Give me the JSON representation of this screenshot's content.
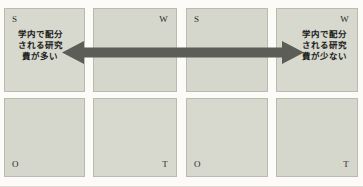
{
  "diagram": {
    "type": "paired-swot-matrix",
    "box_fill_color": "#d6d7cd",
    "box_border_color": "#b9bab0",
    "arrow_color": "#5d5d57",
    "text_color": "#1c1c1a",
    "background_color": "#fcfbf7"
  },
  "matrices": [
    {
      "name": "left-swot-matrix",
      "cells": [
        {
          "key": "s",
          "letter": "S",
          "corner": "top-left"
        },
        {
          "key": "w",
          "letter": "W",
          "corner": "top-right"
        },
        {
          "key": "o",
          "letter": "O",
          "corner": "bottom-left"
        },
        {
          "key": "t",
          "letter": "T",
          "corner": "bottom-right"
        }
      ]
    },
    {
      "name": "right-swot-matrix",
      "cells": [
        {
          "key": "s",
          "letter": "S",
          "corner": "top-left"
        },
        {
          "key": "w",
          "letter": "W",
          "corner": "top-right"
        },
        {
          "key": "o",
          "letter": "O",
          "corner": "bottom-left"
        },
        {
          "key": "t",
          "letter": "T",
          "corner": "bottom-right"
        }
      ]
    }
  ],
  "letters": {
    "m1_s": "S",
    "m1_w": "W",
    "m1_o": "O",
    "m1_t": "T",
    "m2_s": "S",
    "m2_w": "W",
    "m2_o": "O",
    "m2_t": "T"
  },
  "captions": {
    "left": {
      "line1": "学内で配分",
      "line2": "される研究",
      "line3": "費が多い",
      "full": "学内で配分される研究費が多い"
    },
    "right": {
      "line1": "学内で配分",
      "line2": "される研究",
      "line3": "費が少ない",
      "full": "学内で配分される研究費が少ない"
    }
  },
  "arrow": {
    "name": "double-headed-arrow",
    "direction": "bidirectional",
    "color": "#5d5d57"
  }
}
